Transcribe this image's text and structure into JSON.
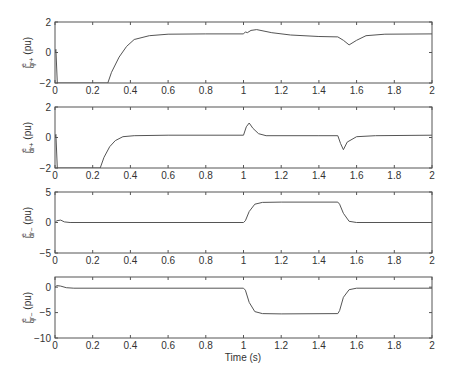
{
  "figure": {
    "xlabel": "Time (s)",
    "x_ticks": [
      "0",
      "0.2",
      "0.4",
      "0.6",
      "0.8",
      "1",
      "1.2",
      "1.4",
      "1.6",
      "1.8",
      "2"
    ]
  },
  "chart_data": [
    {
      "type": "line",
      "ylabel": "i_qr+^e (pu)",
      "ylabel_main": "i",
      "ylabel_sup": "e",
      "ylabel_sub": "qr+",
      "ylabel_unit": "(pu)",
      "xlabel": "",
      "xlim": [
        0,
        2
      ],
      "ylim": [
        -2,
        2
      ],
      "y_ticks": [
        "2",
        "0",
        "-2"
      ],
      "x": [
        0,
        0.005,
        0.012,
        0.28,
        0.3,
        0.34,
        0.38,
        0.42,
        0.5,
        0.6,
        0.8,
        1.0,
        1.01,
        1.02,
        1.04,
        1.07,
        1.15,
        1.25,
        1.4,
        1.5,
        1.53,
        1.56,
        1.6,
        1.65,
        1.75,
        2.0
      ],
      "y": [
        0,
        0.2,
        -2,
        -2,
        -1.3,
        -0.3,
        0.4,
        0.85,
        1.1,
        1.2,
        1.22,
        1.22,
        1.35,
        1.3,
        1.45,
        1.5,
        1.3,
        1.15,
        1.05,
        1.02,
        0.8,
        0.5,
        0.8,
        1.1,
        1.2,
        1.22
      ]
    },
    {
      "type": "line",
      "ylabel": "i_dr+^e (pu)",
      "ylabel_main": "i",
      "ylabel_sup": "e",
      "ylabel_sub": "dr+",
      "ylabel_unit": "(pu)",
      "xlabel": "",
      "xlim": [
        0,
        2
      ],
      "ylim": [
        -2,
        2
      ],
      "y_ticks": [
        "2",
        "0",
        "-2"
      ],
      "x": [
        0,
        0.005,
        0.012,
        0.24,
        0.26,
        0.29,
        0.32,
        0.36,
        0.42,
        0.6,
        1.0,
        1.015,
        1.03,
        1.05,
        1.08,
        1.12,
        1.4,
        1.5,
        1.515,
        1.53,
        1.55,
        1.6,
        1.7,
        2.0
      ],
      "y": [
        0,
        0.2,
        -2,
        -2,
        -1.3,
        -0.6,
        -0.2,
        0.05,
        0.12,
        0.15,
        0.15,
        0.7,
        0.95,
        0.6,
        0.25,
        0.12,
        0.12,
        0.12,
        -0.4,
        -0.8,
        -0.3,
        0.05,
        0.12,
        0.15
      ]
    },
    {
      "type": "line",
      "ylabel": "i_dr-^e (pu)",
      "ylabel_main": "i",
      "ylabel_sup": "e",
      "ylabel_sub": "dr−",
      "ylabel_unit": "(pu)",
      "xlabel": "",
      "xlim": [
        0,
        2
      ],
      "ylim": [
        -5,
        5
      ],
      "y_ticks": [
        "5",
        "0",
        "-5"
      ],
      "x": [
        0,
        0.01,
        0.03,
        0.05,
        0.08,
        1.0,
        1.01,
        1.03,
        1.06,
        1.1,
        1.2,
        1.5,
        1.51,
        1.53,
        1.56,
        1.6,
        2.0
      ],
      "y": [
        0,
        0.3,
        0.4,
        0.1,
        0,
        0,
        0.3,
        1.8,
        3.0,
        3.3,
        3.35,
        3.35,
        3.0,
        1.5,
        0.2,
        0,
        0
      ]
    },
    {
      "type": "line",
      "ylabel": "i_qr-^e (pu)",
      "ylabel_main": "i",
      "ylabel_sup": "e",
      "ylabel_sub": "qr−",
      "ylabel_unit": "(pu)",
      "xlabel": "Time (s)",
      "xlim": [
        0,
        2
      ],
      "ylim": [
        -10,
        2
      ],
      "y_ticks": [
        "0",
        "-5",
        "-10"
      ],
      "x": [
        0,
        0.01,
        0.03,
        0.06,
        0.1,
        1.0,
        1.01,
        1.03,
        1.06,
        1.1,
        1.2,
        1.5,
        1.51,
        1.53,
        1.56,
        1.6,
        2.0
      ],
      "y": [
        0,
        0.3,
        0.2,
        -0.1,
        -0.2,
        -0.2,
        -0.6,
        -3.0,
        -4.8,
        -5.2,
        -5.25,
        -5.2,
        -4.6,
        -2.0,
        -0.5,
        -0.2,
        -0.2
      ]
    }
  ]
}
